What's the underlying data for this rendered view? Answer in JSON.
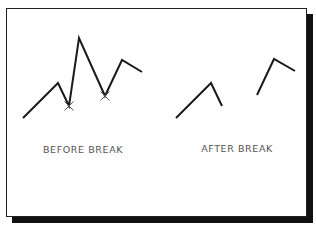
{
  "diagram": {
    "before": {
      "label": "BEFORE BREAK",
      "polyline": [
        [
          23,
          118
        ],
        [
          58,
          83
        ],
        [
          69,
          106
        ],
        [
          79,
          38
        ],
        [
          105,
          96
        ],
        [
          122,
          60
        ],
        [
          142,
          72
        ]
      ],
      "break_points": [
        [
          69,
          106
        ],
        [
          105,
          96
        ]
      ],
      "break_marker": "x-mark-icon"
    },
    "after": {
      "label": "AFTER BREAK",
      "segments": [
        [
          [
            176,
            118
          ],
          [
            211,
            83
          ],
          [
            222,
            106
          ]
        ],
        [
          [
            257,
            95
          ],
          [
            274,
            59
          ],
          [
            295,
            71
          ]
        ]
      ]
    },
    "colors": {
      "line": "#1a1a1a",
      "marker": "#555555",
      "label": "#555555",
      "shadow": "#111111",
      "background": "#ffffff"
    }
  }
}
